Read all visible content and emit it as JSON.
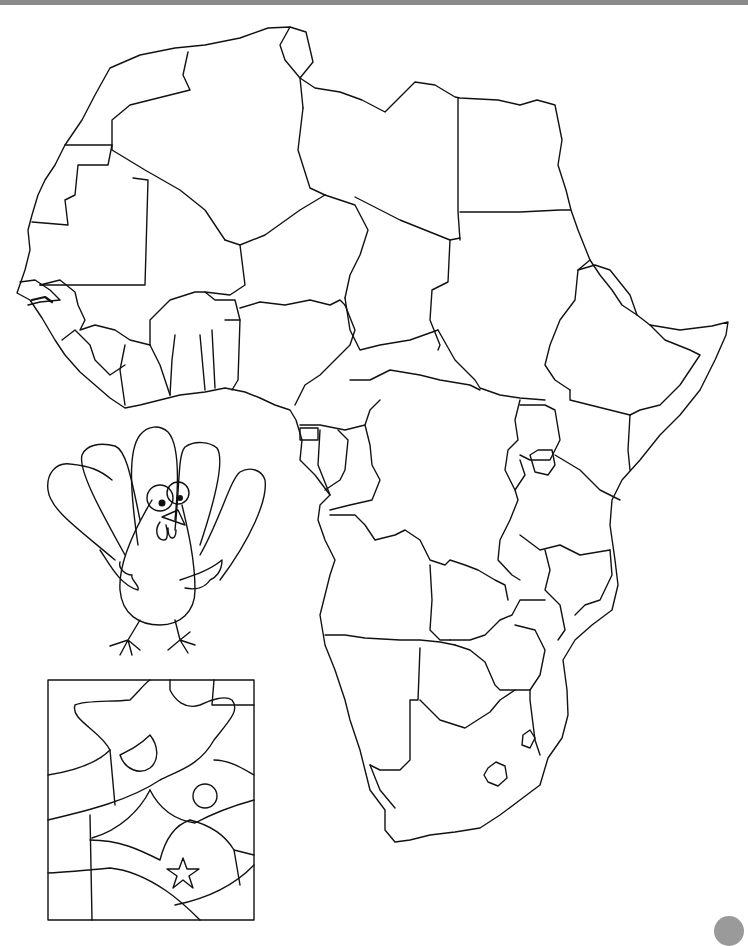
{
  "page": {
    "type": "printable coloring worksheet",
    "background": "#ffffff",
    "line_color": "#111111",
    "top_bar_color": "#8a8a8a",
    "corner_mark_color": "#9a9a9a"
  },
  "map": {
    "subject": "Africa outline map with country borders",
    "labels": []
  },
  "illustrations": [
    {
      "name": "turkey",
      "description": "cartoon turkey with five tail feathers"
    },
    {
      "name": "pattern-box",
      "description": "abstract color-by-region pattern with circle and star"
    }
  ]
}
